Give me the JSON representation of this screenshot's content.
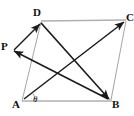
{
  "figure": {
    "canvas": {
      "width": 134,
      "height": 116,
      "background": "#ffffff"
    },
    "colors": {
      "vector_stroke": "#1a1a1a",
      "side_stroke": "#a8a8a8",
      "label_text": "#111111"
    },
    "points": [
      {
        "id": "D",
        "label": "D",
        "x": 40,
        "y": 27,
        "label_x": 35,
        "label_y": 9
      },
      {
        "id": "C",
        "label": "C",
        "x": 124,
        "y": 22,
        "label_x": 126,
        "label_y": 13
      },
      {
        "id": "P",
        "label": "P",
        "x": 13,
        "y": 51,
        "label_x": 1,
        "label_y": 42
      },
      {
        "id": "A",
        "label": "A",
        "x": 23,
        "y": 99,
        "label_x": 12,
        "label_y": 99
      },
      {
        "id": "B",
        "label": "B",
        "x": 109,
        "y": 99,
        "label_x": 112,
        "label_y": 99
      }
    ],
    "sides": [
      {
        "id": "DC",
        "from": "D",
        "to": "C",
        "style": "thin-gray"
      },
      {
        "id": "AB",
        "from": "A",
        "to": "B",
        "style": "thin-gray"
      },
      {
        "id": "AD",
        "from": "A",
        "to": "D",
        "style": "thin-gray"
      },
      {
        "id": "BC",
        "from": "B",
        "to": "C",
        "style": "thin-gray"
      },
      {
        "id": "DB",
        "from": "D",
        "to": "B",
        "style": "thin-gray"
      }
    ],
    "vectors": [
      {
        "id": "PD",
        "label": "P to D",
        "from": "P",
        "to": "D",
        "style": "arrow-dark"
      },
      {
        "id": "PB",
        "label": "P to B",
        "from": "P",
        "to": "B",
        "style": "arrow-dark"
      },
      {
        "id": "AC",
        "label": "A to C",
        "from": "A",
        "to": "C",
        "style": "arrow-dark"
      },
      {
        "id": "BD",
        "label": "B to D",
        "from": "B",
        "to": "D",
        "style": "arrow-dark"
      }
    ],
    "angle": {
      "id": "theta-at-A",
      "symbol": "θ",
      "vertex": "A",
      "label_x": 32,
      "label_y": 96,
      "arc_radius": 11,
      "arc_start_deg": 0,
      "arc_end_deg": 33
    }
  }
}
